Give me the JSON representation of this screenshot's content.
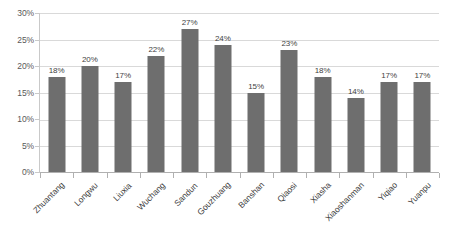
{
  "chart_data": {
    "type": "bar",
    "title": "",
    "subtitle": "",
    "xlabel": "",
    "ylabel": "",
    "ylim": [
      0,
      30
    ],
    "y_tick_step": 5,
    "y_tick_labels": [
      "0%",
      "5%",
      "10%",
      "15%",
      "20%",
      "25%",
      "30%"
    ],
    "y_tick_values": [
      0,
      5,
      10,
      15,
      20,
      25,
      30
    ],
    "grid": true,
    "grid_axis": "y",
    "legend": false,
    "legend_position": "none",
    "value_label_suffix": "%",
    "x_label_rotation_deg": -45,
    "categories": [
      "Zhuantang",
      "Longwu",
      "Liuxia",
      "Wuchang",
      "Sandun",
      "Gouzhuang",
      "Banshan",
      "Qiaosi",
      "Xiasha",
      "Xiaoshanman",
      "Yiqiao",
      "Yuanpu"
    ],
    "values": [
      18,
      20,
      17,
      22,
      27,
      24,
      15,
      23,
      18,
      14,
      17,
      17
    ],
    "data_labels": [
      "18%",
      "20%",
      "17%",
      "22%",
      "27%",
      "24%",
      "15%",
      "23%",
      "18%",
      "14%",
      "17%",
      "17%"
    ],
    "series": [
      {
        "name": "",
        "color": "#6e6e6e",
        "values": [
          18,
          20,
          17,
          22,
          27,
          24,
          15,
          23,
          18,
          14,
          17,
          17
        ]
      }
    ]
  },
  "colors": {
    "bar": "#6e6e6e",
    "gridline": "#d9d9d9",
    "axis": "#b0b0b0",
    "y_tick_text": "#595959",
    "x_label_text": "#404040",
    "value_label_text": "#3f3f3f",
    "background": "#ffffff"
  }
}
